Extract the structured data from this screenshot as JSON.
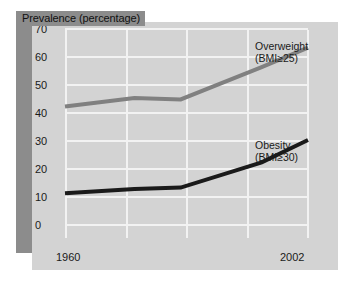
{
  "chart_data": {
    "type": "line",
    "title": "Prevalence (percentage)",
    "xlabel": "",
    "ylabel": "Prevalence (percentage)",
    "ylim": [
      0,
      75
    ],
    "yticks": [
      0,
      10,
      20,
      30,
      40,
      50,
      60,
      70
    ],
    "xlim": [
      1960,
      2002
    ],
    "xticks": [
      1960,
      2002
    ],
    "xtick_labels": [
      "1960",
      "2002"
    ],
    "grid": true,
    "legend_position": "inline-annotation",
    "x": [
      1960,
      1972,
      1980,
      1994,
      2002
    ],
    "series": [
      {
        "name": "Overweight",
        "label": "Overweight",
        "sublabel": "(BMI≥25)",
        "color": "#808080",
        "values": [
          42,
          45,
          44.5,
          56,
          63
        ]
      },
      {
        "name": "Obesity",
        "label": "Obesity",
        "sublabel": "(BMI≥30)",
        "color": "#1a1a1a",
        "values": [
          11,
          12.5,
          13,
          22,
          30
        ]
      }
    ]
  },
  "panel": {
    "background": "#d3d3d3",
    "gridline_color": "#f2f2f2",
    "band_color": "#8c8c8c"
  }
}
